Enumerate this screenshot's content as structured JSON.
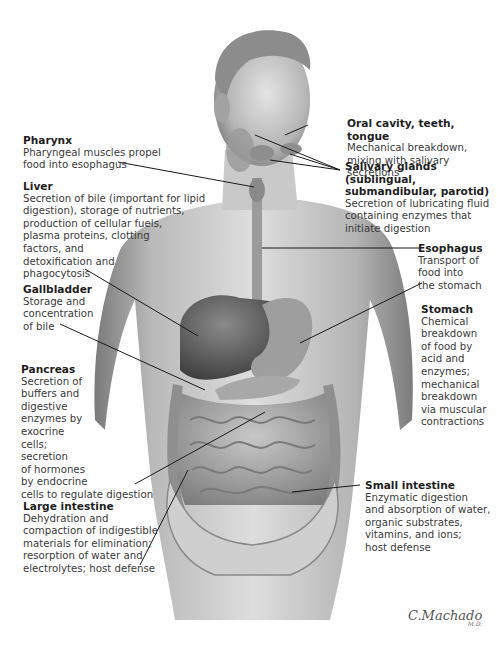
{
  "figure": {
    "signature": "C.Machado",
    "signature_suffix": "M.D."
  },
  "labels": {
    "pharynx": {
      "title": "Pharynx",
      "desc": "Pharyngeal muscles propel\nfood into esophagus"
    },
    "liver": {
      "title": "Liver",
      "desc": "Secretion of bile (important for lipid\ndigestion), storage of nutrients,\nproduction of cellular fuels,\nplasma proteins, clotting\nfactors, and\ndetoxification and\nphagocytosis"
    },
    "gallbladder": {
      "title": "Gallbladder",
      "desc": "Storage and\nconcentration\nof bile"
    },
    "pancreas": {
      "title": "Pancreas",
      "desc": "Secretion of\nbuffers and\ndigestive\nenzymes by\nexocrine\ncells;\nsecretion\nof hormones\nby endocrine\ncells to regulate digestion"
    },
    "large_intestine": {
      "title": "Large intestine",
      "desc": "Dehydration and\ncompaction of indigestible\nmaterials for elimination;\nresorption of water and\nelectrolytes; host defense"
    },
    "oral_cavity": {
      "title": "Oral cavity, teeth, tongue",
      "desc": "Mechanical breakdown,\nmixing with salivary secretions"
    },
    "salivary_glands": {
      "title": "Salivary glands (sublingual,\nsubmandibular, parotid)",
      "desc": "Secretion of lubricating fluid\ncontaining enzymes that\ninitiate digestion"
    },
    "esophagus": {
      "title": "Esophagus",
      "desc": "Transport of\nfood into\nthe stomach"
    },
    "stomach": {
      "title": "Stomach",
      "desc": "Chemical\nbreakdown\nof food by\nacid and\nenzymes;\nmechanical\nbreakdown\nvia muscular\ncontractions"
    },
    "small_intestine": {
      "title": "Small intestine",
      "desc": "Enzymatic digestion\nand absorption of water,\norganic substrates,\nvitamins, and ions;\nhost defense"
    }
  },
  "colors": {
    "background": "#ffffff",
    "skin_light": "#d9d9d9",
    "skin_mid": "#a9a9a9",
    "skin_dark": "#6e6e6e",
    "organ_dark": "#4a4a4a",
    "leader_line": "#1a1a1a"
  }
}
